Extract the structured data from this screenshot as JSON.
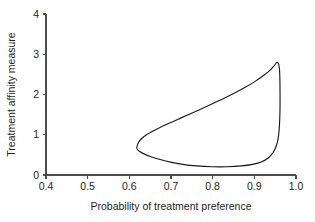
{
  "chart_data": {
    "type": "line",
    "title": "",
    "subtitle": "",
    "xlabel": "Probability of treatment preference",
    "ylabel": "Treatment affinity measure",
    "xlim": [
      0.4,
      1.0
    ],
    "ylim": [
      0,
      4
    ],
    "xticks": [
      0.4,
      0.5,
      0.6,
      0.7,
      0.8,
      0.9,
      1.0
    ],
    "xtick_labels": [
      "0.4",
      "0.5",
      "0.6",
      "0.7",
      "0.8",
      "0.9",
      "1.0"
    ],
    "yticks": [
      0,
      1,
      2,
      3,
      4
    ],
    "ytick_labels": [
      "0",
      "1",
      "2",
      "3",
      "4"
    ],
    "grid": false,
    "legend": false,
    "legend_position": "none",
    "line_color": "#1a1a1a",
    "series": [
      {
        "name": "confidence region boundary",
        "closed": true,
        "annotation": "closed contour / joint confidence region",
        "points": [
          [
            0.618,
            0.68
          ],
          [
            0.621,
            0.79
          ],
          [
            0.629,
            0.9
          ],
          [
            0.643,
            1.01
          ],
          [
            0.664,
            1.13
          ],
          [
            0.69,
            1.26
          ],
          [
            0.72,
            1.4
          ],
          [
            0.752,
            1.545
          ],
          [
            0.785,
            1.7
          ],
          [
            0.817,
            1.855
          ],
          [
            0.848,
            2.01
          ],
          [
            0.876,
            2.165
          ],
          [
            0.901,
            2.32
          ],
          [
            0.922,
            2.47
          ],
          [
            0.938,
            2.605
          ],
          [
            0.948,
            2.72
          ],
          [
            0.953,
            2.79
          ],
          [
            0.9555,
            2.8
          ],
          [
            0.958,
            2.76
          ],
          [
            0.96,
            2.66
          ],
          [
            0.961,
            2.5
          ],
          [
            0.9615,
            2.28
          ],
          [
            0.9617,
            2.0
          ],
          [
            0.9617,
            1.7
          ],
          [
            0.961,
            1.4
          ],
          [
            0.9595,
            1.12
          ],
          [
            0.957,
            0.9
          ],
          [
            0.9525,
            0.72
          ],
          [
            0.945,
            0.56
          ],
          [
            0.934,
            0.43
          ],
          [
            0.918,
            0.33
          ],
          [
            0.896,
            0.265
          ],
          [
            0.868,
            0.225
          ],
          [
            0.835,
            0.205
          ],
          [
            0.799,
            0.205
          ],
          [
            0.762,
            0.225
          ],
          [
            0.728,
            0.265
          ],
          [
            0.699,
            0.32
          ],
          [
            0.674,
            0.385
          ],
          [
            0.652,
            0.455
          ],
          [
            0.635,
            0.525
          ],
          [
            0.624,
            0.59
          ],
          [
            0.619,
            0.64
          ],
          [
            0.618,
            0.68
          ]
        ]
      }
    ]
  },
  "axes": {
    "x_axis_name": "x-axis",
    "y_axis_name": "y-axis"
  }
}
